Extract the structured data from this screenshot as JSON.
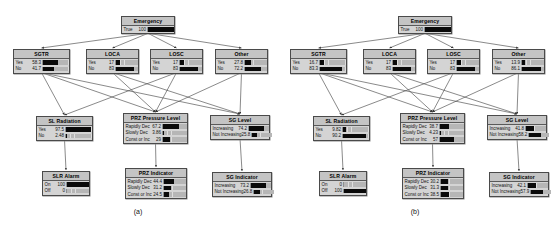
{
  "figure": {
    "captions": [
      {
        "id": "a",
        "text": "(a)"
      },
      {
        "id": "b",
        "text": "(b)"
      }
    ],
    "colors": {
      "node_fill": "#d4d4d4",
      "node_border": "#4a4a4a",
      "title_fill": "#c4c4c4",
      "bar": "#0a0a0a",
      "bar_track": "#b6b6b6"
    }
  },
  "chart_data": {
    "type": "bar",
    "xlabel": "",
    "ylabel": "Probability (%)",
    "ylim": [
      0,
      100
    ],
    "panels": [
      {
        "id": "a",
        "caption": "(a)",
        "nodes": [
          {
            "name": "Emergency",
            "categories": [
              "True"
            ],
            "values": [
              100
            ]
          },
          {
            "name": "SGTR",
            "categories": [
              "Yes",
              "No"
            ],
            "values": [
              58.3,
              41.7
            ]
          },
          {
            "name": "LOCA",
            "categories": [
              "Yes",
              "No"
            ],
            "values": [
              17.0,
              83.0
            ]
          },
          {
            "name": "LOSC",
            "categories": [
              "Yes",
              "No"
            ],
            "values": [
              17.0,
              83.0
            ]
          },
          {
            "name": "Other",
            "categories": [
              "Yes",
              "No"
            ],
            "values": [
              27.8,
              72.2
            ]
          },
          {
            "name": "SL Radiation",
            "categories": [
              "Yes",
              "No"
            ],
            "values": [
              97.5,
              2.48
            ]
          },
          {
            "name": "PRZ Pressure Level",
            "categories": [
              "Rapidly Dec",
              "Slowly Dec",
              "Const or Inc"
            ],
            "values": [
              67.2,
              3.86,
              29.0
            ]
          },
          {
            "name": "SG Level",
            "categories": [
              "Increasing",
              "Not Increasing"
            ],
            "values": [
              74.2,
              25.8
            ]
          },
          {
            "name": "SLR Alarm",
            "categories": [
              "On",
              "Off"
            ],
            "values": [
              100,
              0
            ]
          },
          {
            "name": "PRZ Indicator",
            "categories": [
              "Rapidly Dec",
              "Slowly Dec",
              "Const or Inc"
            ],
            "values": [
              44.4,
              31.2,
              24.5
            ]
          },
          {
            "name": "SG Indicator",
            "categories": [
              "Increasing",
              "Not Increasing"
            ],
            "values": [
              73.2,
              26.8
            ]
          }
        ]
      },
      {
        "id": "b",
        "caption": "(b)",
        "nodes": [
          {
            "name": "Emergency",
            "categories": [
              "True"
            ],
            "values": [
              100
            ]
          },
          {
            "name": "SGTR",
            "categories": [
              "Yes",
              "No"
            ],
            "values": [
              16.7,
              83.3
            ]
          },
          {
            "name": "LOCA",
            "categories": [
              "Yes",
              "No"
            ],
            "values": [
              17.0,
              83.0
            ]
          },
          {
            "name": "LOSC",
            "categories": [
              "Yes",
              "No"
            ],
            "values": [
              17.0,
              83.0
            ]
          },
          {
            "name": "Other",
            "categories": [
              "Yes",
              "No"
            ],
            "values": [
              13.9,
              86.1
            ]
          },
          {
            "name": "SL Radiation",
            "categories": [
              "Yes",
              "No"
            ],
            "values": [
              9.82,
              90.2
            ]
          },
          {
            "name": "PRZ Pressure Level",
            "categories": [
              "Rapidly Dec",
              "Slowly Dec",
              "Const or Inc"
            ],
            "values": [
              38.7,
              4.23,
              57.0
            ]
          },
          {
            "name": "SG Level",
            "categories": [
              "Increasing",
              "Not Increasing"
            ],
            "values": [
              41.8,
              58.2
            ]
          },
          {
            "name": "SLR Alarm",
            "categories": [
              "On",
              "Off"
            ],
            "values": [
              0,
              100
            ]
          },
          {
            "name": "PRZ Indicator",
            "categories": [
              "Rapidly Dec",
              "Slowly Dec",
              "Const or Inc"
            ],
            "values": [
              30.2,
              31.3,
              38.5
            ]
          },
          {
            "name": "SG Indicator",
            "categories": [
              "Increasing",
              "Not Increasing"
            ],
            "values": [
              42.1,
              57.9
            ]
          }
        ]
      }
    ],
    "edges": [
      [
        "Emergency",
        "SGTR"
      ],
      [
        "Emergency",
        "LOCA"
      ],
      [
        "Emergency",
        "LOSC"
      ],
      [
        "Emergency",
        "Other"
      ],
      [
        "SGTR",
        "SL Radiation"
      ],
      [
        "SGTR",
        "PRZ Pressure Level"
      ],
      [
        "SGTR",
        "SG Level"
      ],
      [
        "LOCA",
        "PRZ Pressure Level"
      ],
      [
        "LOCA",
        "SG Level"
      ],
      [
        "LOSC",
        "PRZ Pressure Level"
      ],
      [
        "LOSC",
        "SL Radiation"
      ],
      [
        "Other",
        "PRZ Pressure Level"
      ],
      [
        "Other",
        "SG Level"
      ],
      [
        "SL Radiation",
        "SLR Alarm"
      ],
      [
        "PRZ Pressure Level",
        "PRZ Indicator"
      ],
      [
        "SG Level",
        "SG Indicator"
      ]
    ]
  },
  "layout": {
    "nodes": [
      {
        "name": "Emergency",
        "x": 121,
        "y": 16,
        "w": 54,
        "valw": 22,
        "barw": 26
      },
      {
        "name": "SGTR",
        "x": 13,
        "y": 49,
        "w": 57,
        "valw": 20,
        "barw": 26
      },
      {
        "name": "LOCA",
        "x": 86,
        "y": 49,
        "w": 53,
        "valw": 20,
        "barw": 22
      },
      {
        "name": "LOSC",
        "x": 150,
        "y": 49,
        "w": 53,
        "valw": 20,
        "barw": 22
      },
      {
        "name": "Other",
        "x": 215,
        "y": 49,
        "w": 53,
        "valw": 20,
        "barw": 22
      },
      {
        "name": "SL Radiation",
        "x": 36,
        "y": 116,
        "w": 57,
        "valw": 20,
        "barw": 26
      },
      {
        "name": "PRZ Pressure Level",
        "x": 123,
        "y": 113,
        "w": 65,
        "valw": 15,
        "barw": 24
      },
      {
        "name": "SG Level",
        "x": 210,
        "y": 115,
        "w": 60,
        "valw": 14,
        "barw": 20
      },
      {
        "name": "SLR Alarm",
        "x": 42,
        "y": 171,
        "w": 48,
        "valw": 16,
        "barw": 22
      },
      {
        "name": "PRZ Indicator",
        "x": 125,
        "y": 168,
        "w": 62,
        "valw": 14,
        "barw": 22
      },
      {
        "name": "SG Indicator",
        "x": 212,
        "y": 172,
        "w": 60,
        "valw": 14,
        "barw": 20
      }
    ]
  }
}
